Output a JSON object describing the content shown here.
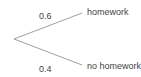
{
  "diagram": {
    "type": "probability-tree",
    "branches": [
      {
        "probability": "0.6",
        "outcome": "homework"
      },
      {
        "probability": "0.4",
        "outcome": "no homework"
      }
    ],
    "line_color": "#888888"
  }
}
